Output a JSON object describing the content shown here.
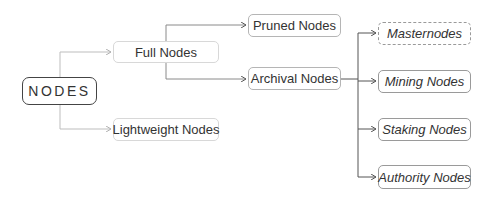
{
  "diagram": {
    "type": "tree",
    "root": {
      "id": "nodes",
      "label": "NODES"
    },
    "nodes": [
      {
        "id": "full",
        "label": "Full Nodes",
        "parent": "nodes"
      },
      {
        "id": "lightweight",
        "label": "Lightweight Nodes",
        "parent": "nodes"
      },
      {
        "id": "pruned",
        "label": "Pruned Nodes",
        "parent": "full"
      },
      {
        "id": "archival",
        "label": "Archival Nodes",
        "parent": "full"
      },
      {
        "id": "masternodes",
        "label": "Masternodes",
        "parent": "archival",
        "style": "dashed"
      },
      {
        "id": "mining",
        "label": "Mining Nodes",
        "parent": "archival"
      },
      {
        "id": "staking",
        "label": "Staking Nodes",
        "parent": "archival"
      },
      {
        "id": "authority",
        "label": "Authority Nodes",
        "parent": "archival"
      }
    ]
  },
  "labels": {
    "root": "NODES",
    "full": "Full Nodes",
    "lightweight": "Lightweight Nodes",
    "pruned": "Pruned Nodes",
    "archival": "Archival Nodes",
    "masternodes": "Masternodes",
    "mining": "Mining Nodes",
    "staking": "Staking Nodes",
    "authority": "Authority Nodes"
  },
  "colors": {
    "connector_light": "#c8c8c8",
    "connector_dark": "#555555",
    "root_border": "#444444",
    "text": "#333333"
  }
}
